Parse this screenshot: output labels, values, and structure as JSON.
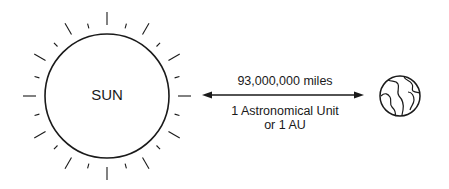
{
  "diagram": {
    "sun": {
      "label": "SUN",
      "center": [
        107,
        96
      ],
      "radius": 62,
      "ray_count": 24
    },
    "distance": {
      "value_label": "93,000,000 miles",
      "unit_label_line1": "1 Astronomical Unit",
      "unit_label_line2": "or 1 AU"
    },
    "earth": {
      "center": [
        400,
        96
      ],
      "radius": 20
    },
    "colors": {
      "stroke": "#1a1a1a",
      "background": "#ffffff"
    }
  }
}
